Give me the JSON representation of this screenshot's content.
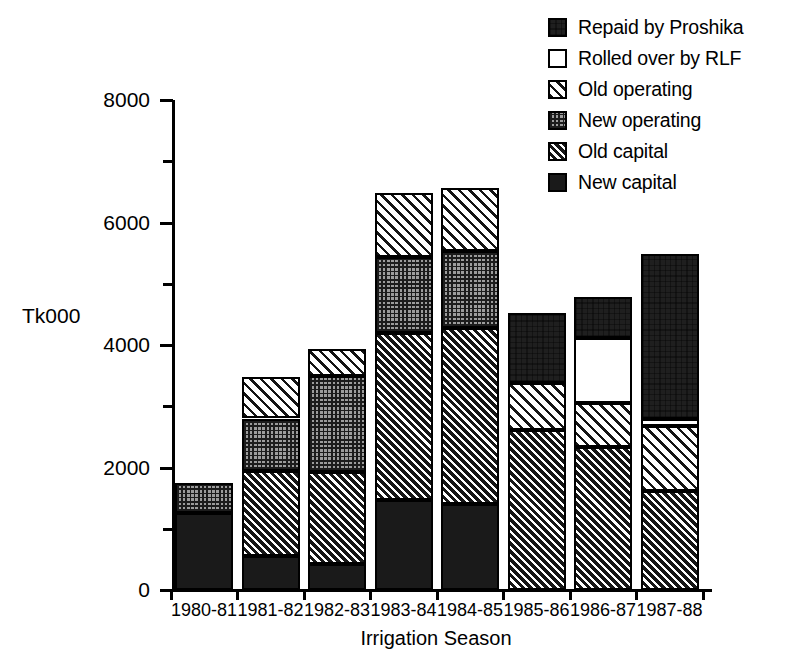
{
  "chart": {
    "type": "bar",
    "title": "",
    "ylabel": "Tk000",
    "xlabel": "Irrigation Season"
  },
  "axis": {
    "y_ticks": [
      "0",
      "2000",
      "4000",
      "6000",
      "8000"
    ],
    "y_min": 0,
    "y_max": 8000
  },
  "legend": {
    "items": [
      {
        "label": "Repaid by Proshika",
        "pattern": "repaid",
        "swatch_name": "legend-swatch-repaid-by-proshika"
      },
      {
        "label": "Rolled over by RLF",
        "pattern": "rolled-over",
        "swatch_name": "legend-swatch-rolled-over-by-rlf"
      },
      {
        "label": "Old operating",
        "pattern": "old-operating",
        "swatch_name": "legend-swatch-old-operating"
      },
      {
        "label": "New operating",
        "pattern": "new-operating",
        "swatch_name": "legend-swatch-new-operating"
      },
      {
        "label": "Old capital",
        "pattern": "old-capital",
        "swatch_name": "legend-swatch-old-capital"
      },
      {
        "label": "New capital",
        "pattern": "new-capital",
        "swatch_name": "legend-swatch-new-capital"
      }
    ]
  },
  "chart_data": {
    "type": "bar",
    "stacked": true,
    "title": "",
    "xlabel": "Irrigation Season",
    "ylabel": "Tk000",
    "ylim": [
      0,
      8000
    ],
    "y_ticks": [
      0,
      2000,
      4000,
      6000,
      8000
    ],
    "y_minor_tick_interval": 1000,
    "grid": false,
    "legend_position": "top-right",
    "categories": [
      "1980-81",
      "1981-82",
      "1982-83",
      "1983-84",
      "1984-85",
      "1985-86",
      "1986-87",
      "1987-88"
    ],
    "series": [
      {
        "name": "New capital",
        "values": [
          1250,
          550,
          420,
          1470,
          1400,
          0,
          0,
          0
        ]
      },
      {
        "name": "Old capital",
        "values": [
          0,
          1400,
          1510,
          2730,
          2870,
          2620,
          2340,
          1620
        ]
      },
      {
        "name": "New operating",
        "values": [
          500,
          850,
          1560,
          1230,
          1270,
          0,
          0,
          0
        ]
      },
      {
        "name": "Old operating",
        "values": [
          0,
          680,
          440,
          1050,
          1020,
          760,
          720,
          1060
        ]
      },
      {
        "name": "Rolled over by RLF",
        "values": [
          0,
          0,
          0,
          0,
          0,
          0,
          1060,
          110
        ]
      },
      {
        "name": "Repaid by Proshika",
        "values": [
          0,
          0,
          0,
          0,
          0,
          1140,
          660,
          2690
        ]
      }
    ],
    "totals": [
      1750,
      3480,
      3930,
      6480,
      6560,
      4520,
      4780,
      5480
    ]
  },
  "colors": {
    "foreground": "#000000",
    "background": "#ffffff",
    "new_capital": "#1a1a1a",
    "old_capital": "#161616",
    "new_operating": "#9c9c9c",
    "old_operating": "#ffffff",
    "rolled_over": "#ffffff",
    "repaid": "#1f1f1f"
  }
}
